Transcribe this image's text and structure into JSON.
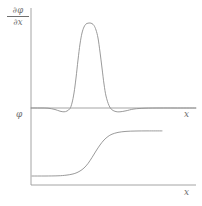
{
  "figure": {
    "width": 202,
    "height": 206,
    "background": "#ffffff",
    "line_color": "#8e8e8e",
    "axis_color": "#9a9a9a",
    "text_color": "#6f6f6f"
  },
  "labels": {
    "derivative_numerator": "∂φ",
    "derivative_denominator": "∂x",
    "phi": "φ",
    "x_top": "x",
    "x_bottom": "x"
  },
  "chart_data": [
    {
      "type": "line",
      "title": "",
      "xlabel": "x",
      "ylabel": "∂φ/∂x",
      "grid": false,
      "legend": "none",
      "axis_origin_px": {
        "x": 31,
        "y": 108
      },
      "axis_extent_px": {
        "x_end": 196,
        "y_top": 8
      },
      "description": "Flat-topped super-Gaussian bump centred near x=88 px with small symmetric undershoots on both flanks",
      "x": [
        31,
        40,
        48,
        55,
        60,
        64,
        67,
        70,
        72,
        74,
        76,
        78,
        80,
        82,
        84,
        86,
        88,
        90,
        92,
        94,
        96,
        98,
        100,
        102,
        104,
        106,
        109,
        112,
        116,
        120,
        126,
        134,
        145,
        160,
        175,
        196
      ],
      "y": [
        108,
        108,
        108.2,
        109.5,
        111.2,
        111.8,
        111.0,
        108.5,
        103.0,
        93.0,
        78.0,
        60.0,
        44.0,
        33.0,
        27.0,
        24.0,
        23.2,
        23.0,
        23.6,
        25.5,
        30.0,
        38.0,
        52.0,
        68.0,
        84.0,
        96.0,
        105.5,
        109.8,
        111.6,
        111.8,
        110.8,
        109.0,
        108.2,
        108.0,
        108.0,
        108.0
      ],
      "ylim": [
        112,
        23
      ]
    },
    {
      "type": "line",
      "title": "",
      "xlabel": "x",
      "ylabel": "φ",
      "grid": false,
      "legend": "none",
      "axis_origin_px": {
        "x": 31,
        "y": 185
      },
      "axis_extent_px": {
        "x_end": 196,
        "y_top": 118
      },
      "description": "Smooth monotonic sigmoid step rising from a low plateau to a high plateau, ending at x=162 px",
      "x": [
        32,
        45,
        58,
        66,
        72,
        76,
        80,
        84,
        88,
        92,
        96,
        100,
        104,
        108,
        112,
        118,
        126,
        136,
        148,
        162
      ],
      "y": [
        176,
        176,
        175.8,
        175.2,
        174.2,
        173.0,
        171.0,
        168.0,
        163.5,
        157.5,
        151.0,
        145.0,
        140.0,
        136.5,
        134.2,
        132.4,
        131.4,
        131.0,
        130.9,
        130.9
      ],
      "ylim": [
        177,
        130
      ]
    }
  ]
}
